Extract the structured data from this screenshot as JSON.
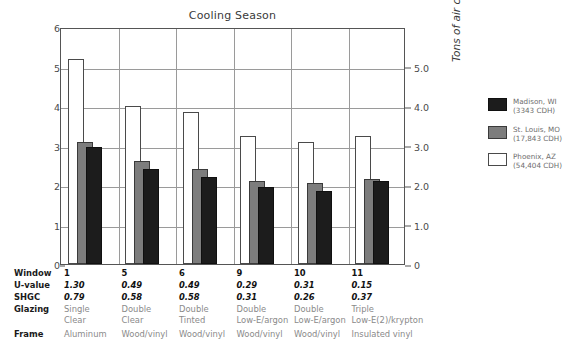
{
  "chart_data": {
    "type": "bar",
    "title": "Cooling Season",
    "xlabel": "",
    "ylabel": "Peak Cooling Load (kW)",
    "ylabel_right": "Tons of air conditioning",
    "categories": [
      "1",
      "5",
      "6",
      "9",
      "10",
      "11"
    ],
    "ylim": [
      0,
      6
    ],
    "yticks": [
      "0",
      "1",
      "2",
      "3",
      "4",
      "5",
      "6"
    ],
    "ylim_right": [
      0,
      5.0
    ],
    "yticks_right": [
      "0",
      "1.0",
      "2.0",
      "3.0",
      "4.0",
      "5.0"
    ],
    "grid": true,
    "legend_position": "right",
    "series": [
      {
        "name": "Madison, WI",
        "sublabel": "(3343 CDH)",
        "color": "#1c1c1c",
        "values": [
          2.95,
          2.4,
          2.2,
          1.95,
          1.85,
          2.1
        ]
      },
      {
        "name": "St. Louis, MO",
        "sublabel": "(17,843 CDH)",
        "color": "#7d7d7d",
        "values": [
          3.1,
          2.6,
          2.4,
          2.1,
          2.05,
          2.15
        ]
      },
      {
        "name": "Phoenix, AZ",
        "sublabel": "(54,404 CDH)",
        "color": "#ffffff",
        "values": [
          5.2,
          4.0,
          3.85,
          3.25,
          3.1,
          3.25
        ]
      }
    ]
  },
  "legend": {
    "entries": [
      {
        "label": "Madison, WI",
        "sub": "(3343 CDH)"
      },
      {
        "label": "St. Louis, MO",
        "sub": "(17,843 CDH)"
      },
      {
        "label": "Phoenix, AZ",
        "sub": "(54,404 CDH)"
      }
    ]
  },
  "table": {
    "row_labels": [
      "Window",
      "U-value",
      "SHGC",
      "Glazing",
      "Frame"
    ],
    "columns": [
      {
        "window": "1",
        "u_value": "1.30",
        "shgc": "0.79",
        "glazing_1": "Single",
        "glazing_2": "Clear",
        "frame": "Aluminum"
      },
      {
        "window": "5",
        "u_value": "0.49",
        "shgc": "0.58",
        "glazing_1": "Double",
        "glazing_2": "Clear",
        "frame": "Wood/vinyl"
      },
      {
        "window": "6",
        "u_value": "0.49",
        "shgc": "0.58",
        "glazing_1": "Double",
        "glazing_2": "Tinted",
        "frame": "Wood/vinyl"
      },
      {
        "window": "9",
        "u_value": "0.29",
        "shgc": "0.31",
        "glazing_1": "Double",
        "glazing_2": "Low-E/argon",
        "frame": "Wood/vinyl"
      },
      {
        "window": "10",
        "u_value": "0.31",
        "shgc": "0.26",
        "glazing_1": "Double",
        "glazing_2": "Low-E/argon",
        "frame": "Wood/vinyl"
      },
      {
        "window": "11",
        "u_value": "0.15",
        "shgc": "0.37",
        "glazing_1": "Triple",
        "glazing_2": "Low-E(2)/krypton",
        "frame": "Insulated vinyl"
      }
    ]
  }
}
